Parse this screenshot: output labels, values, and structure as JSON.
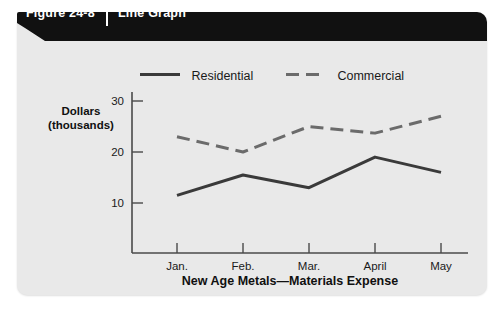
{
  "figure": {
    "number_label": "Figure 24-8",
    "type_label": "Line Graph"
  },
  "colors": {
    "panel_background": "#e9e9e9",
    "banner_background": "#111111",
    "banner_text": "#ffffff",
    "residential_line": "#3a3a3a",
    "commercial_line": "#6b6b6b",
    "axis": "#4a4a4a",
    "text": "#1a1a1a"
  },
  "chart_data": {
    "type": "line",
    "title": "New Age Metals—Materials Expense",
    "xlabel": "",
    "ylabel": "Dollars (thousands)",
    "ylabel_lines": [
      "Dollars",
      "(thousands)"
    ],
    "categories": [
      "Jan.",
      "Feb.",
      "Mar.",
      "April",
      "May"
    ],
    "series": [
      {
        "name": "Residential",
        "style": "solid",
        "color": "#3a3a3a",
        "values": [
          11.5,
          15.5,
          13,
          19,
          16
        ]
      },
      {
        "name": "Commercial",
        "style": "dashed",
        "color": "#6b6b6b",
        "values": [
          23,
          20,
          25,
          23.7,
          27
        ]
      }
    ],
    "yticks": [
      10,
      20,
      30
    ],
    "ytick_labels": [
      "10",
      "20",
      "30"
    ],
    "ylim": [
      0,
      32
    ],
    "grid": false,
    "legend_position": "top"
  }
}
